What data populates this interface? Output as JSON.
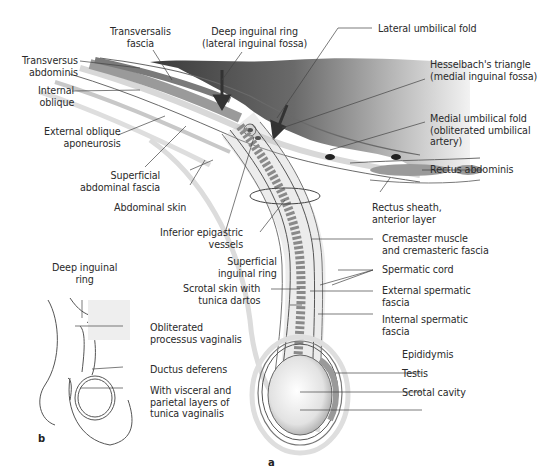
{
  "figure": {
    "panels": [
      "a",
      "b"
    ],
    "colors": {
      "peritoneal_cavity_dark": "#4a4a4a",
      "peritoneal_cavity_light": "#f0f0f0",
      "muscle": "#8a8a8a",
      "fascia_line": "#6e6e6e",
      "skin": "#dcdcdc",
      "leader_line": "#444444",
      "text": "#2a2a2a"
    }
  },
  "labels_a": {
    "transversalis_fascia": "Transversalis\nfascia",
    "deep_inguinal_ring": "Deep inguinal ring\n(lateral inguinal fossa)",
    "lateral_umbilical_fold": "Lateral umbilical fold",
    "hesselbach": "Hesselbach's triangle\n(medial inguinal fossa)",
    "transversus_abdominis": "Transversus\nabdominis",
    "internal_oblique": "Internal\noblique",
    "external_oblique": "External oblique\naponeurosis",
    "medial_umbilical_fold": "Medial umbilical fold\n(obliterated umbilical\nartery)",
    "superficial_abdominal_fascia": "Superficial\nabdominal fascia",
    "rectus_abdominis": "Rectus abdominis",
    "abdominal_skin": "Abdominal skin",
    "rectus_sheath": "Rectus sheath,\nanterior layer",
    "inferior_epigastric": "Inferior epigastric\nvessels",
    "cremaster": "Cremaster muscle\nand cremasteric fascia",
    "superficial_inguinal_ring": "Superficial\ninguinal ring",
    "spermatic_cord": "Spermatic cord",
    "scrotal_skin": "Scrotal skin with\ntunica dartos",
    "external_spermatic_fascia": "External spermatic\nfascia",
    "internal_spermatic_fascia": "Internal spermatic\nfascia",
    "epididymis": "Epididymis",
    "testis": "Testis",
    "scrotal_cavity": "Scrotal cavity"
  },
  "labels_b": {
    "deep_inguinal_ring": "Deep inguinal\nring",
    "obliterated_processus": "Obliterated\nprocessus vaginalis",
    "ductus_deferens": "Ductus deferens",
    "tunica_vaginalis": "With visceral and\nparietal layers of\ntunica vaginalis"
  }
}
